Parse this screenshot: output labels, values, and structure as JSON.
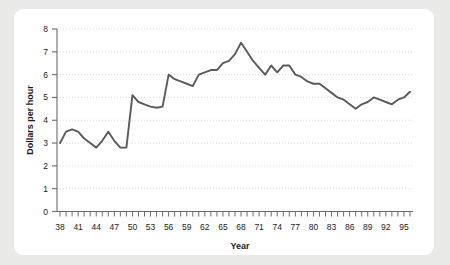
{
  "chart_data": {
    "type": "line",
    "title": "",
    "subtitle": "",
    "xlabel": "Year",
    "ylabel": "Dollars per hour",
    "xlim": [
      37.5,
      96.5
    ],
    "ylim": [
      0,
      8
    ],
    "grid": true,
    "grid_axis": "y",
    "legend": "none",
    "line_color": "#5a5a5a",
    "x_tick_labels": [
      "38",
      "41",
      "44",
      "47",
      "50",
      "53",
      "56",
      "59",
      "62",
      "65",
      "68",
      "71",
      "74",
      "77",
      "80",
      "83",
      "86",
      "89",
      "92",
      "95"
    ],
    "x_tick_values": [
      38,
      41,
      44,
      47,
      50,
      53,
      56,
      59,
      62,
      65,
      68,
      71,
      74,
      77,
      80,
      83,
      86,
      89,
      92,
      95
    ],
    "x_minor_tick_step": 1,
    "y_tick_labels": [
      "0",
      "1",
      "2",
      "3",
      "4",
      "5",
      "6",
      "7",
      "8"
    ],
    "y_tick_values": [
      0,
      1,
      2,
      3,
      4,
      5,
      6,
      7,
      8
    ],
    "x": [
      38,
      39,
      40,
      41,
      42,
      43,
      44,
      45,
      46,
      47,
      48,
      49,
      50,
      51,
      52,
      53,
      54,
      55,
      56,
      57,
      58,
      59,
      60,
      61,
      62,
      63,
      64,
      65,
      66,
      67,
      68,
      69,
      70,
      71,
      72,
      73,
      74,
      75,
      76,
      77,
      78,
      79,
      80,
      81,
      82,
      83,
      84,
      85,
      86,
      87,
      88,
      89,
      90,
      91,
      92,
      93,
      94,
      95,
      96
    ],
    "series": [
      {
        "name": "Dollars per hour",
        "values": [
          3.0,
          3.5,
          3.6,
          3.5,
          3.2,
          3.0,
          2.8,
          3.1,
          3.5,
          3.1,
          2.8,
          2.8,
          5.1,
          4.8,
          4.7,
          4.6,
          4.55,
          4.6,
          6.0,
          5.8,
          5.7,
          5.6,
          5.5,
          6.0,
          6.1,
          6.2,
          6.2,
          6.5,
          6.6,
          6.9,
          7.4,
          7.0,
          6.6,
          6.3,
          6.0,
          6.4,
          6.1,
          6.4,
          6.4,
          6.0,
          5.9,
          5.7,
          5.6,
          5.6,
          5.4,
          5.2,
          5.0,
          4.9,
          4.7,
          4.5,
          4.7,
          4.8,
          5.0,
          4.9,
          4.8,
          4.7,
          4.9,
          5.0,
          5.25
        ]
      }
    ]
  },
  "ylabel_text": "Dollars per hour",
  "xlabel_text": "Year"
}
